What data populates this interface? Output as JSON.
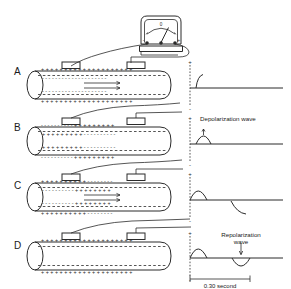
{
  "figure": {
    "title_visible": false,
    "rows": [
      {
        "label": "A",
        "state": "resting / polarized",
        "outside_charge": "+",
        "inside_charge": "-",
        "has_flow_arrows": true,
        "annotation": "",
        "annotation_lines": [],
        "waveform": "small upward hook then flat baseline"
      },
      {
        "label": "B",
        "state": "depolarization in progress",
        "outside_charge": "+/-",
        "inside_charge": "-/+",
        "has_flow_arrows": false,
        "annotation": "Depolarization wave",
        "annotation_lines": [
          "Depolarization  wave"
        ],
        "waveform": "upward rounded deflection"
      },
      {
        "label": "C",
        "state": "repolarization beginning",
        "outside_charge": "+/-",
        "inside_charge": "-/+",
        "has_flow_arrows": true,
        "annotation": "",
        "annotation_lines": [],
        "waveform": "upward bump then downward curve"
      },
      {
        "label": "D",
        "state": "repolarized",
        "outside_charge": "+",
        "inside_charge": "-",
        "has_flow_arrows": false,
        "annotation": "Repolarization wave",
        "annotation_lines": [
          "Repolarization",
          "wave"
        ],
        "waveform": "upward bump then downward trough"
      }
    ],
    "meter": {
      "name": "galvanometer",
      "scale_center_label": "0",
      "left_terminal_sign": "-",
      "right_terminal_sign": "+"
    },
    "axis": {
      "positive_sign": "+",
      "negative_sign": "-"
    },
    "scale_bar": {
      "label": "0.30 second"
    },
    "electrodes": {
      "count": 2,
      "left_label": "",
      "right_label": ""
    },
    "colors": {
      "ink": "#2b2b2b",
      "background": "#ffffff"
    }
  }
}
